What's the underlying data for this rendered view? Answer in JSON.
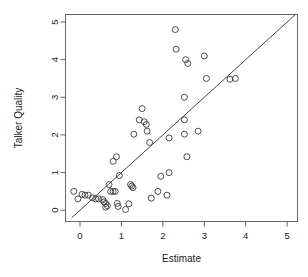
{
  "chart_data": {
    "type": "scatter",
    "title": "",
    "xlabel": "Estimate",
    "ylabel": "Talker Quality",
    "xlim": [
      -0.35,
      5.25
    ],
    "ylim": [
      -0.3,
      5.2
    ],
    "xticks": [
      0,
      1,
      2,
      3,
      4,
      5
    ],
    "yticks": [
      0,
      1,
      2,
      3,
      4,
      5
    ],
    "xtick_labels": [
      "0",
      "1",
      "2",
      "3",
      "4",
      "5"
    ],
    "ytick_labels": [
      "0",
      "1",
      "2",
      "3",
      "4",
      "5"
    ],
    "grid": false,
    "legend": null,
    "point_marker": "open-circle",
    "point_radius": 3.0,
    "reference_line": {
      "label": "identity line y = x",
      "slope": 1,
      "intercept": 0,
      "x_start": -0.2,
      "y_start": -0.2,
      "x_end": 5.2,
      "y_end": 5.2
    },
    "points": [
      {
        "x": -0.15,
        "y": 0.5
      },
      {
        "x": -0.05,
        "y": 0.3
      },
      {
        "x": 0.05,
        "y": 0.42
      },
      {
        "x": 0.12,
        "y": 0.4
      },
      {
        "x": 0.2,
        "y": 0.4
      },
      {
        "x": 0.3,
        "y": 0.33
      },
      {
        "x": 0.38,
        "y": 0.3
      },
      {
        "x": 0.45,
        "y": 0.3
      },
      {
        "x": 0.55,
        "y": 0.28
      },
      {
        "x": 0.58,
        "y": 0.22
      },
      {
        "x": 0.62,
        "y": 0.18
      },
      {
        "x": 0.62,
        "y": 0.08
      },
      {
        "x": 0.66,
        "y": 0.12
      },
      {
        "x": 0.7,
        "y": 0.68
      },
      {
        "x": 0.74,
        "y": 0.5
      },
      {
        "x": 0.8,
        "y": 0.5
      },
      {
        "x": 0.85,
        "y": 0.5
      },
      {
        "x": 0.8,
        "y": 1.3
      },
      {
        "x": 0.88,
        "y": 1.42
      },
      {
        "x": 0.9,
        "y": 0.18
      },
      {
        "x": 0.92,
        "y": 0.1
      },
      {
        "x": 0.95,
        "y": 0.92
      },
      {
        "x": 1.1,
        "y": 0.02
      },
      {
        "x": 1.18,
        "y": 0.17
      },
      {
        "x": 1.22,
        "y": 0.68
      },
      {
        "x": 1.25,
        "y": 0.64
      },
      {
        "x": 1.28,
        "y": 0.6
      },
      {
        "x": 1.3,
        "y": 2.02
      },
      {
        "x": 1.43,
        "y": 2.4
      },
      {
        "x": 1.5,
        "y": 2.7
      },
      {
        "x": 1.55,
        "y": 2.35
      },
      {
        "x": 1.6,
        "y": 2.28
      },
      {
        "x": 1.62,
        "y": 2.1
      },
      {
        "x": 1.68,
        "y": 1.8
      },
      {
        "x": 1.72,
        "y": 0.32
      },
      {
        "x": 1.88,
        "y": 0.5
      },
      {
        "x": 1.95,
        "y": 0.9
      },
      {
        "x": 2.1,
        "y": 0.4
      },
      {
        "x": 2.15,
        "y": 1.0
      },
      {
        "x": 2.15,
        "y": 1.92
      },
      {
        "x": 2.3,
        "y": 4.8
      },
      {
        "x": 2.32,
        "y": 4.28
      },
      {
        "x": 2.52,
        "y": 3.0
      },
      {
        "x": 2.52,
        "y": 2.4
      },
      {
        "x": 2.52,
        "y": 2.02
      },
      {
        "x": 2.55,
        "y": 4.0
      },
      {
        "x": 2.6,
        "y": 3.9
      },
      {
        "x": 2.58,
        "y": 1.42
      },
      {
        "x": 2.85,
        "y": 2.1
      },
      {
        "x": 3.0,
        "y": 4.1
      },
      {
        "x": 3.05,
        "y": 3.5
      },
      {
        "x": 3.62,
        "y": 3.48
      },
      {
        "x": 3.75,
        "y": 3.5
      }
    ]
  }
}
